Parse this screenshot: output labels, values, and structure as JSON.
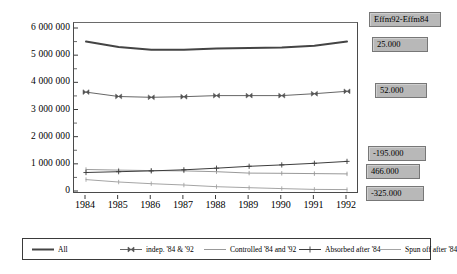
{
  "chart_data": {
    "type": "line",
    "title": "",
    "xlabel": "",
    "ylabel": "",
    "categories": [
      "1984",
      "1985",
      "1986",
      "1987",
      "1988",
      "1989",
      "1990",
      "1991",
      "1992"
    ],
    "ytick_labels": [
      "6 000 000",
      "5 000 000",
      "4 000 000",
      "3 000 000",
      "2 000 000",
      "1 000 000",
      "0"
    ],
    "ytick_values": [
      6000000,
      5000000,
      4000000,
      3000000,
      2000000,
      1000000,
      0
    ],
    "ylim": [
      0,
      6000000
    ],
    "grid": false,
    "legend_position": "bottom",
    "series": [
      {
        "name": "All",
        "values": [
          5500000,
          5300000,
          5200000,
          5200000,
          5250000,
          5260000,
          5280000,
          5350000,
          5500000
        ],
        "color": "#444444",
        "width": 2.0,
        "marker": "none"
      },
      {
        "name": "indep. '84 & '92",
        "values": [
          3640000,
          3480000,
          3450000,
          3470000,
          3510000,
          3510000,
          3510000,
          3580000,
          3670000
        ],
        "color": "#555555",
        "width": 0.9,
        "marker": "bowtie"
      },
      {
        "name": "Controlled '84 and '92",
        "values": [
          790000,
          770000,
          750000,
          740000,
          710000,
          660000,
          650000,
          640000,
          630000
        ],
        "color": "#8d8d8d",
        "width": 0.9,
        "marker": "tick"
      },
      {
        "name": "Absorbed after '84",
        "values": [
          680000,
          710000,
          740000,
          780000,
          840000,
          910000,
          960000,
          1020000,
          1090000
        ],
        "color": "#3d3d3d",
        "width": 1.0,
        "marker": "plus"
      },
      {
        "name": "Spun off after '84",
        "values": [
          420000,
          330000,
          270000,
          220000,
          160000,
          120000,
          90000,
          60000,
          50000
        ],
        "color": "#9a9a9a",
        "width": 0.9,
        "marker": "tick"
      }
    ]
  },
  "value_boxes": {
    "header": "Effm92-Effm84",
    "items": [
      {
        "label": "25.000"
      },
      {
        "label": "52.000"
      },
      {
        "label": "-195.000"
      },
      {
        "label": "466.000"
      },
      {
        "label": "-325.000"
      }
    ]
  },
  "legend": {
    "items": [
      {
        "label": "All"
      },
      {
        "label": "indep. '84 & '92"
      },
      {
        "label": "Controlled '84 and '92"
      },
      {
        "label": "Absorbed after '84"
      },
      {
        "label": "Spun off after '84"
      }
    ]
  }
}
